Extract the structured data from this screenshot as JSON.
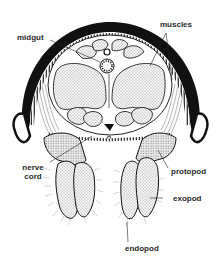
{
  "diagram": {
    "colors": {
      "background": "#ffffff",
      "outline": "#111111",
      "stipple": "#e6e6e6",
      "label_text": "#2a2a2a"
    },
    "labels": {
      "midgut": "midgut",
      "muscles": "muscles",
      "nerve_cord_line1": "nerve",
      "nerve_cord_line2": "cord",
      "protopod": "protopod",
      "exopod": "exopod",
      "endopod": "endopod"
    }
  }
}
